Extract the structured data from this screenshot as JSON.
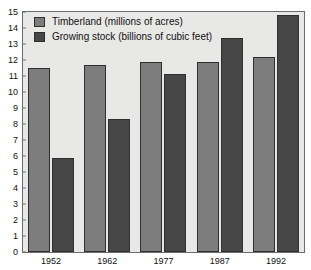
{
  "chart_data": {
    "type": "bar",
    "title": "",
    "xlabel": "",
    "ylabel": "",
    "ylim": [
      0,
      15
    ],
    "ytick_step": 1,
    "yticks": [
      "0",
      "1",
      "2",
      "3",
      "4",
      "5",
      "6",
      "7",
      "8",
      "9",
      "10",
      "11",
      "12",
      "13",
      "14",
      "15"
    ],
    "grid": false,
    "legend_position": "top-left",
    "categories": [
      "1952",
      "1962",
      "1977",
      "1987",
      "1992"
    ],
    "series": [
      {
        "name": "Timberland (millions of acres)",
        "color": "#7d7d7d",
        "values": [
          11.5,
          11.7,
          11.9,
          11.9,
          12.2
        ]
      },
      {
        "name": "Growing stock (billions of cubic feet)",
        "color": "#474747",
        "values": [
          5.9,
          8.3,
          11.1,
          13.4,
          14.8
        ]
      }
    ]
  },
  "plot": {
    "background_color": "#e8e8e6",
    "border_color": "#6d6d6d",
    "bar_outline_color": "#2f2f2f"
  }
}
